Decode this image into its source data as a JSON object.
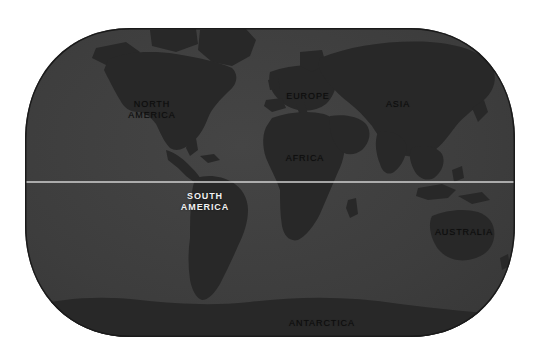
{
  "map": {
    "name": "world-map",
    "projection": "robinson-rounded-rectangle",
    "background_color": "#ffffff",
    "ocean_color": "#3d3d3d",
    "land_color": "#282828",
    "outline_color": "#1a1a1a",
    "equator_line_color": "#d8d8d8",
    "equator_label": "equator",
    "bounds": {
      "left": 25,
      "right": 515,
      "top": 28,
      "bottom": 337
    },
    "labels": [
      {
        "id": "north-america",
        "text": "NORTH\nAMERICA",
        "x": 152,
        "y": 110,
        "style": "dark",
        "font_size": 9
      },
      {
        "id": "south-america",
        "text": "SOUTH\nAMERICA",
        "x": 205,
        "y": 202,
        "style": "bright",
        "font_size": 9
      },
      {
        "id": "europe",
        "text": "EUROPE",
        "x": 308,
        "y": 96,
        "style": "dark",
        "font_size": 9
      },
      {
        "id": "africa",
        "text": "AFRICA",
        "x": 305,
        "y": 158,
        "style": "dark",
        "font_size": 9
      },
      {
        "id": "asia",
        "text": "ASIA",
        "x": 398,
        "y": 104,
        "style": "dark",
        "font_size": 9
      },
      {
        "id": "australia",
        "text": "AUSTRALIA",
        "x": 464,
        "y": 232,
        "style": "dark",
        "font_size": 9
      },
      {
        "id": "antarctica",
        "text": "ANTARCTICA",
        "x": 322,
        "y": 323,
        "style": "dark",
        "font_size": 9
      }
    ]
  }
}
